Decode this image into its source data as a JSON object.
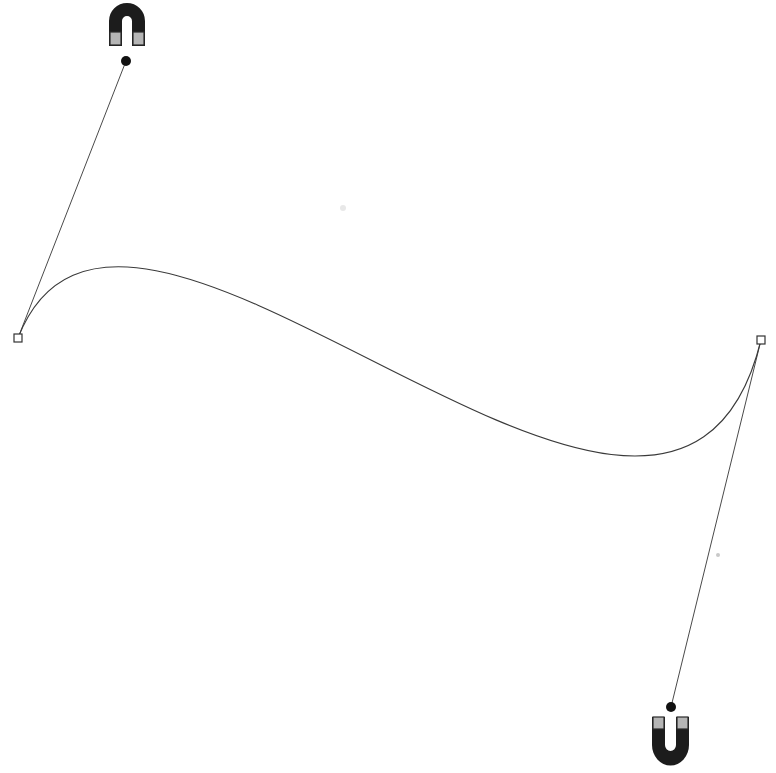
{
  "canvas": {
    "width": 776,
    "height": 773,
    "background_color": "#ffffff",
    "description": "Vector path editing canvas showing a single cubic Bezier S-curve with two direction handles, each handle terminating at a horseshoe magnet icon."
  },
  "colors": {
    "stroke": "#3a3a3a",
    "handle_line": "#4a4a4a",
    "anchor_fill": "#ffffff",
    "anchor_stroke": "#333333",
    "handle_dot": "#111111",
    "magnet_body": "#1c1c1c",
    "magnet_pole": "#b5b5b5",
    "magnet_pole_edge": "#2a2a2a",
    "faint_mark": "#e3e3e3"
  },
  "path": {
    "name": "bezier-s-curve",
    "type": "cubic-bezier",
    "stroke_width": 1,
    "fill": "none",
    "start_anchor": {
      "x": 18,
      "y": 338
    },
    "end_anchor": {
      "x": 761,
      "y": 340
    },
    "control_point_1": {
      "x": 126,
      "y": 61
    },
    "control_point_2": {
      "x": 671,
      "y": 707
    },
    "d": "M 18 338 C 126 61, 671 707, 761 340",
    "apex": {
      "x": 135,
      "y": 262
    },
    "valley": {
      "x": 640,
      "y": 458
    }
  },
  "anchors": [
    {
      "id": "start",
      "label": "start-anchor",
      "x": 18,
      "y": 338,
      "shape": "square",
      "size": 8,
      "selected": false
    },
    {
      "id": "end",
      "label": "end-anchor",
      "x": 761,
      "y": 340,
      "shape": "square",
      "size": 8,
      "selected": false
    }
  ],
  "handles": [
    {
      "id": "handle-1",
      "label": "control-handle-start",
      "from": {
        "x": 18,
        "y": 338
      },
      "to": {
        "x": 126,
        "y": 61
      },
      "dot_radius": 5
    },
    {
      "id": "handle-2",
      "label": "control-handle-end",
      "from": {
        "x": 761,
        "y": 340
      },
      "to": {
        "x": 671,
        "y": 707
      },
      "dot_radius": 5
    }
  ],
  "magnets": [
    {
      "id": "magnet-top",
      "label": "horseshoe-magnet-inverted",
      "orientation": "inverted-u",
      "x": 105,
      "y": 4,
      "width": 44,
      "height": 42,
      "poles_at": "bottom"
    },
    {
      "id": "magnet-bottom",
      "label": "horseshoe-magnet-upright",
      "orientation": "upright-u",
      "x": 648,
      "y": 715,
      "width": 45,
      "height": 53,
      "poles_at": "top"
    }
  ],
  "faint_marks": [
    {
      "id": "mark-1",
      "x": 343,
      "y": 208,
      "radius": 3
    },
    {
      "id": "mark-2",
      "x": 718,
      "y": 555,
      "radius": 2
    }
  ]
}
